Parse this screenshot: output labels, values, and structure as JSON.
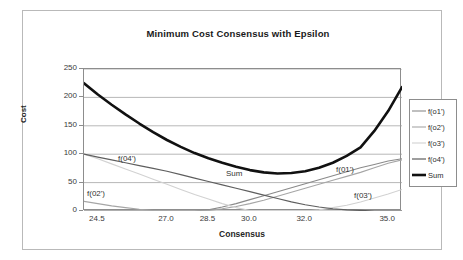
{
  "chart_data": {
    "type": "line",
    "title": "Minimum Cost Consensus with Epsilon",
    "xlabel": "Consensus",
    "ylabel": "Cost",
    "xlim": [
      24.0,
      35.5
    ],
    "ylim": [
      0,
      250
    ],
    "grid": true,
    "legend_position": "right",
    "xtick_labels": [
      "24.5",
      "27.0",
      "28.5",
      "30.0",
      "32.0",
      "35.0"
    ],
    "xtick_values": [
      24.5,
      27.0,
      28.5,
      30.0,
      32.0,
      35.0
    ],
    "ytick_labels": [
      "0",
      "50",
      "100",
      "150",
      "200",
      "250"
    ],
    "ytick_values": [
      0,
      50,
      100,
      150,
      200,
      250
    ],
    "x": [
      24.0,
      24.5,
      25.0,
      25.5,
      26.0,
      26.5,
      27.0,
      27.5,
      28.0,
      28.5,
      29.0,
      29.5,
      30.0,
      30.5,
      31.0,
      31.5,
      32.0,
      32.5,
      33.0,
      33.5,
      34.0,
      34.5,
      35.0,
      35.5
    ],
    "series": [
      {
        "name": "f(o1')",
        "color": "#8a8a8a",
        "width": 1.1,
        "values": [
          0,
          0,
          0,
          0,
          0,
          0,
          0,
          0,
          0,
          2,
          7,
          13,
          20,
          27,
          34,
          41,
          48,
          55,
          62,
          69,
          76,
          82,
          88,
          92
        ]
      },
      {
        "name": "f(o2')",
        "color": "#a6a6a6",
        "width": 1.1,
        "values": [
          17,
          13,
          9,
          6,
          3,
          1,
          0,
          0,
          0,
          1,
          4,
          8,
          13,
          19,
          26,
          33,
          40,
          47,
          54,
          61,
          68,
          76,
          84,
          90
        ]
      },
      {
        "name": "f(o3')",
        "color": "#d2d2d2",
        "width": 1.1,
        "values": [
          100,
          92,
          83,
          74,
          65,
          56,
          47,
          38,
          29,
          21,
          13,
          6,
          1,
          0,
          0,
          0,
          0,
          2,
          6,
          10,
          16,
          23,
          30,
          38
        ]
      },
      {
        "name": "f(o4')",
        "color": "#5e5e5e",
        "width": 1.2,
        "values": [
          100,
          95,
          90,
          85,
          80,
          75,
          70,
          64,
          58,
          52,
          46,
          40,
          34,
          28,
          22,
          16,
          11,
          7,
          4,
          2,
          1,
          0,
          0,
          0
        ]
      },
      {
        "name": "Sum",
        "color": "#111111",
        "width": 2.6,
        "values": [
          225,
          205,
          187,
          170,
          154,
          139,
          125,
          113,
          102,
          93,
          85,
          78,
          72,
          68,
          66,
          67,
          70,
          76,
          85,
          97,
          112,
          141,
          176,
          218
        ]
      }
    ],
    "annotations": [
      {
        "text": "f(04')",
        "x": 95,
        "y": 143
      },
      {
        "text": "f(02')",
        "x": 64,
        "y": 178
      },
      {
        "text": "Sum",
        "x": 203,
        "y": 158
      },
      {
        "text": "f(01')",
        "x": 313,
        "y": 154
      },
      {
        "text": "f(03')",
        "x": 331,
        "y": 180
      }
    ]
  },
  "legend": {
    "items": [
      {
        "label": "f(o1')"
      },
      {
        "label": "f(o2')"
      },
      {
        "label": "f(o3')"
      },
      {
        "label": "f(o4')"
      },
      {
        "label": "Sum"
      }
    ]
  }
}
